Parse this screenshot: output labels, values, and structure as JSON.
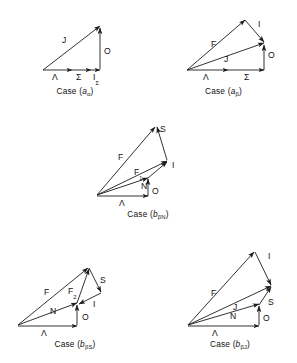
{
  "figure": {
    "background_color": "#ffffff",
    "line_color": "#1c1c1c",
    "panel_count": 5
  },
  "panels": [
    {
      "id": "case-a-alpha",
      "caption_prefix": "Case (",
      "caption_letter": "a",
      "caption_sub": "α",
      "caption_suffix": ")",
      "caption_full": "Case (aα)",
      "vectors": [
        {
          "name": "J",
          "label": "J",
          "sub": ""
        },
        {
          "name": "O",
          "label": "O",
          "sub": ""
        },
        {
          "name": "Lambda",
          "label": "Λ",
          "sub": ""
        },
        {
          "name": "Sigma",
          "label": "Σ",
          "sub": ""
        },
        {
          "name": "I-sigma",
          "label": "I",
          "sub": "Σ"
        }
      ]
    },
    {
      "id": "case-a-beta",
      "caption_prefix": "Case (",
      "caption_letter": "a",
      "caption_sub": "β",
      "caption_suffix": ")",
      "caption_full": "Case (aβ)",
      "vectors": [
        {
          "name": "F",
          "label": "F",
          "sub": ""
        },
        {
          "name": "I",
          "label": "I",
          "sub": ""
        },
        {
          "name": "J",
          "label": "J",
          "sub": ""
        },
        {
          "name": "O",
          "label": "O",
          "sub": ""
        },
        {
          "name": "Lambda",
          "label": "Λ",
          "sub": ""
        },
        {
          "name": "Sigma",
          "label": "Σ",
          "sub": ""
        }
      ]
    },
    {
      "id": "case-b-beta-n",
      "caption_prefix": "Case (",
      "caption_letter": "b",
      "caption_sub": "βN",
      "caption_suffix": ")",
      "caption_full": "Case (bβN)",
      "vectors": [
        {
          "name": "F",
          "label": "F",
          "sub": ""
        },
        {
          "name": "S",
          "label": "S",
          "sub": ""
        },
        {
          "name": "F1",
          "label": "F",
          "sub": "1"
        },
        {
          "name": "I",
          "label": "I",
          "sub": ""
        },
        {
          "name": "N",
          "label": "N",
          "sub": ""
        },
        {
          "name": "O",
          "label": "O",
          "sub": ""
        },
        {
          "name": "Lambda",
          "label": "Λ",
          "sub": ""
        }
      ]
    },
    {
      "id": "case-b-beta-s",
      "caption_prefix": "Case (",
      "caption_letter": "b",
      "caption_sub": "βS",
      "caption_suffix": ")",
      "caption_full": "Case (bβS)",
      "vectors": [
        {
          "name": "F",
          "label": "F",
          "sub": ""
        },
        {
          "name": "F2",
          "label": "F",
          "sub": "2"
        },
        {
          "name": "S",
          "label": "S",
          "sub": ""
        },
        {
          "name": "I",
          "label": "I",
          "sub": ""
        },
        {
          "name": "N",
          "label": "N",
          "sub": ""
        },
        {
          "name": "O",
          "label": "O",
          "sub": ""
        },
        {
          "name": "Lambda",
          "label": "Λ",
          "sub": ""
        }
      ]
    },
    {
      "id": "case-b-beta-j",
      "caption_prefix": "Case (",
      "caption_letter": "b",
      "caption_sub": "βJ",
      "caption_suffix": ")",
      "caption_full": "Case (bβJ)",
      "vectors": [
        {
          "name": "F",
          "label": "F",
          "sub": ""
        },
        {
          "name": "I",
          "label": "I",
          "sub": ""
        },
        {
          "name": "J",
          "label": "J",
          "sub": ""
        },
        {
          "name": "S",
          "label": "S",
          "sub": ""
        },
        {
          "name": "N",
          "label": "N",
          "sub": ""
        },
        {
          "name": "O",
          "label": "O",
          "sub": ""
        },
        {
          "name": "Lambda",
          "label": "Λ",
          "sub": ""
        }
      ]
    }
  ],
  "labels": {
    "p1_J": "J",
    "p1_O": "O",
    "p1_Lambda": "Λ",
    "p1_Sigma": "Σ",
    "p1_I": "I",
    "p1_I_sub": "Σ",
    "p2_F": "F",
    "p2_I": "I",
    "p2_J": "J",
    "p2_O": "O",
    "p2_Lambda": "Λ",
    "p2_Sigma": "Σ",
    "p3_F": "F",
    "p3_S": "S",
    "p3_F1": "F",
    "p3_F1_sub": "1",
    "p3_I": "I",
    "p3_N": "N",
    "p3_O": "O",
    "p3_Lambda": "Λ",
    "p4_F": "F",
    "p4_F2": "F",
    "p4_F2_sub": "2",
    "p4_S": "S",
    "p4_I": "I",
    "p4_N": "N",
    "p4_O": "O",
    "p4_Lambda": "Λ",
    "p5_F": "F",
    "p5_I": "I",
    "p5_J": "J",
    "p5_S": "S",
    "p5_N": "N",
    "p5_O": "O",
    "p5_Lambda": "Λ"
  },
  "captions": {
    "c1_pre": "Case (",
    "c1_letter": "a",
    "c1_sub": "α",
    "c1_post": ")",
    "c2_pre": "Case (",
    "c2_letter": "a",
    "c2_sub": "β",
    "c2_post": ")",
    "c3_pre": "Case (",
    "c3_letter": "b",
    "c3_sub": "βN",
    "c3_post": ")",
    "c4_pre": "Case (",
    "c4_letter": "b",
    "c4_sub": "βS",
    "c4_post": ")",
    "c5_pre": "Case (",
    "c5_letter": "b",
    "c5_sub": "βJ",
    "c5_post": ")"
  }
}
